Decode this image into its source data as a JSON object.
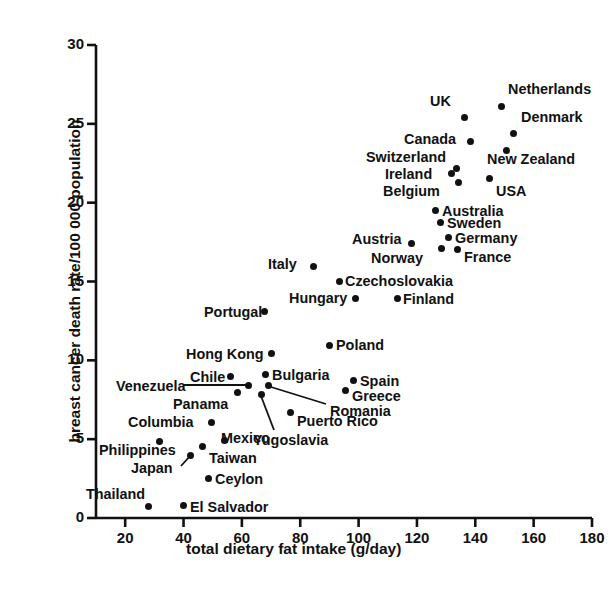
{
  "chart_data": {
    "type": "scatter",
    "title": "",
    "xlabel": "total dietary fat intake (g/day)",
    "ylabel": "breast cancer death rate/100 000 population",
    "xlim": [
      10,
      180
    ],
    "ylim": [
      0,
      30
    ],
    "xticks": [
      20,
      40,
      60,
      80,
      100,
      120,
      140,
      160,
      180
    ],
    "yticks": [
      0,
      5,
      10,
      15,
      20,
      25,
      30
    ],
    "grid": false,
    "legend": "none",
    "marker_color": "#111111",
    "points": [
      {
        "label": "Netherlands",
        "x": 150,
        "y": 26.1,
        "px": 501,
        "py": 106,
        "lx": 508,
        "ly": 82,
        "anchor": "left"
      },
      {
        "label": "Denmark",
        "x": 154,
        "y": 24.4,
        "px": 513,
        "py": 133,
        "lx": 521,
        "ly": 110,
        "anchor": "left"
      },
      {
        "label": "New Zealand",
        "x": 152,
        "y": 23.3,
        "px": 506,
        "py": 150,
        "lx": 487,
        "ly": 152,
        "anchor": "left"
      },
      {
        "label": "UK",
        "x": 138,
        "y": 25.0,
        "px": 464,
        "py": 117,
        "lx": 430,
        "ly": 94,
        "anchor": "left"
      },
      {
        "label": "Canada",
        "x": 140,
        "y": 23.6,
        "px": 470,
        "py": 141,
        "lx": 404,
        "ly": 132,
        "anchor": "left"
      },
      {
        "label": "Switzerland",
        "x": 136,
        "y": 22.3,
        "px": 456,
        "py": 168,
        "lx": 366,
        "ly": 150,
        "anchor": "left"
      },
      {
        "label": "Ireland",
        "x": 134,
        "y": 21.9,
        "px": 451,
        "py": 173,
        "lx": 385,
        "ly": 167,
        "anchor": "left"
      },
      {
        "label": "Belgium",
        "x": 135,
        "y": 21.3,
        "px": 458,
        "py": 182,
        "lx": 383,
        "ly": 184,
        "anchor": "left"
      },
      {
        "label": "USA",
        "x": 146,
        "y": 21.5,
        "px": 489,
        "py": 178,
        "lx": 496,
        "ly": 184,
        "anchor": "left"
      },
      {
        "label": "Australia",
        "x": 127,
        "y": 19.6,
        "px": 435,
        "py": 210,
        "lx": 442,
        "ly": 204,
        "anchor": "left"
      },
      {
        "label": "Sweden",
        "x": 129,
        "y": 18.8,
        "px": 440,
        "py": 222,
        "lx": 447,
        "ly": 216,
        "anchor": "left"
      },
      {
        "label": "Germany",
        "x": 132,
        "y": 17.9,
        "px": 448,
        "py": 237,
        "lx": 455,
        "ly": 231,
        "anchor": "left"
      },
      {
        "label": "Norway",
        "x": 129,
        "y": 17.2,
        "px": 441,
        "py": 248,
        "lx": 371,
        "ly": 251,
        "anchor": "left"
      },
      {
        "label": "France",
        "x": 135,
        "y": 17.1,
        "px": 457,
        "py": 249,
        "lx": 464,
        "ly": 250,
        "anchor": "left"
      },
      {
        "label": "Austria",
        "x": 118,
        "y": 17.4,
        "px": 411,
        "py": 243,
        "lx": 352,
        "ly": 232,
        "anchor": "left"
      },
      {
        "label": "Italy",
        "x": 85,
        "y": 16.0,
        "px": 313,
        "py": 266,
        "lx": 268,
        "ly": 257,
        "anchor": "left"
      },
      {
        "label": "Czechoslovakia",
        "x": 94,
        "y": 15.0,
        "px": 339,
        "py": 281,
        "lx": 345,
        "ly": 274,
        "anchor": "left"
      },
      {
        "label": "Hungary",
        "x": 99,
        "y": 14.0,
        "px": 355,
        "py": 298,
        "lx": 289,
        "ly": 291,
        "anchor": "left"
      },
      {
        "label": "Finland",
        "x": 114,
        "y": 14.0,
        "px": 397,
        "py": 298,
        "lx": 403,
        "ly": 292,
        "anchor": "left"
      },
      {
        "label": "Portugal",
        "x": 69,
        "y": 13.0,
        "px": 264,
        "py": 311,
        "lx": 204,
        "ly": 305,
        "anchor": "left"
      },
      {
        "label": "Poland",
        "x": 90,
        "y": 10.6,
        "px": 329,
        "py": 345,
        "lx": 336,
        "ly": 338,
        "anchor": "left"
      },
      {
        "label": "Hong Kong",
        "x": 70,
        "y": 10.1,
        "px": 271,
        "py": 353,
        "lx": 186,
        "ly": 347,
        "anchor": "left"
      },
      {
        "label": "Bulgaria",
        "x": 68,
        "y": 8.8,
        "px": 265,
        "py": 374,
        "lx": 272,
        "ly": 368,
        "anchor": "left"
      },
      {
        "label": "Spain",
        "x": 99,
        "y": 8.6,
        "px": 353,
        "py": 380,
        "lx": 360,
        "ly": 374,
        "anchor": "left"
      },
      {
        "label": "Chile",
        "x": 56,
        "y": 8.5,
        "px": 230,
        "py": 376,
        "lx": 190,
        "ly": 370,
        "anchor": "left"
      },
      {
        "label": "Venezuela",
        "x": 62,
        "y": 8.4,
        "px": 248,
        "py": 385,
        "lx": 116,
        "ly": 379,
        "anchor": "left",
        "leader": [
          184,
          385,
          248,
          385
        ]
      },
      {
        "label": "Greece",
        "x": 96,
        "y": 8.0,
        "px": 345,
        "py": 390,
        "lx": 352,
        "ly": 389,
        "anchor": "left"
      },
      {
        "label": "Panama",
        "x": 58,
        "y": 7.9,
        "px": 237,
        "py": 392,
        "lx": 173,
        "ly": 397,
        "anchor": "left"
      },
      {
        "label": "Romania",
        "x": 68,
        "y": 8.7,
        "px": 268,
        "py": 385,
        "lx": 330,
        "ly": 404,
        "anchor": "left",
        "leader": [
          271,
          387,
          326,
          404
        ]
      },
      {
        "label": "Puerto Rico",
        "x": 75,
        "y": 6.9,
        "px": 290,
        "py": 412,
        "lx": 297,
        "ly": 414,
        "anchor": "left"
      },
      {
        "label": "Columbia",
        "x": 49,
        "y": 6.1,
        "px": 211,
        "py": 422,
        "lx": 128,
        "ly": 415,
        "anchor": "left"
      },
      {
        "label": "Yugoslavia",
        "x": 66,
        "y": 8.2,
        "px": 261,
        "py": 394,
        "lx": 253,
        "ly": 433,
        "anchor": "left",
        "leader": [
          261,
          396,
          274,
          430
        ]
      },
      {
        "label": "Mexico",
        "x": 55,
        "y": 5.3,
        "px": 224,
        "py": 440,
        "lx": 221,
        "ly": 431,
        "anchor": "left"
      },
      {
        "label": "Philippines",
        "x": 31,
        "y": 4.9,
        "px": 159,
        "py": 441,
        "lx": 99,
        "ly": 443,
        "anchor": "left"
      },
      {
        "label": "Taiwan",
        "x": 46,
        "y": 4.6,
        "px": 202,
        "py": 446,
        "lx": 209,
        "ly": 451,
        "anchor": "left"
      },
      {
        "label": "Japan",
        "x": 42,
        "y": 3.9,
        "px": 190,
        "py": 455,
        "lx": 131,
        "ly": 461,
        "anchor": "left",
        "leader": [
          181,
          466,
          190,
          456
        ]
      },
      {
        "label": "Ceylon",
        "x": 48,
        "y": 2.5,
        "px": 208,
        "py": 478,
        "lx": 215,
        "ly": 472,
        "anchor": "left"
      },
      {
        "label": "Thailand",
        "x": 27,
        "y": 0.8,
        "px": 148,
        "py": 506,
        "lx": 86,
        "ly": 487,
        "anchor": "left"
      },
      {
        "label": "El Salvador",
        "x": 39,
        "y": 0.9,
        "px": 183,
        "py": 505,
        "lx": 190,
        "ly": 500,
        "anchor": "left"
      }
    ]
  },
  "axes": {
    "x_tick_labels": [
      "20",
      "40",
      "60",
      "80",
      "100",
      "120",
      "140",
      "160",
      "180"
    ],
    "y_tick_labels": [
      "0",
      "5",
      "10",
      "15",
      "20",
      "25",
      "30"
    ],
    "x_title": "total dietary fat intake (g/day)",
    "y_title": "breast cancer death rate/100 000 population"
  }
}
